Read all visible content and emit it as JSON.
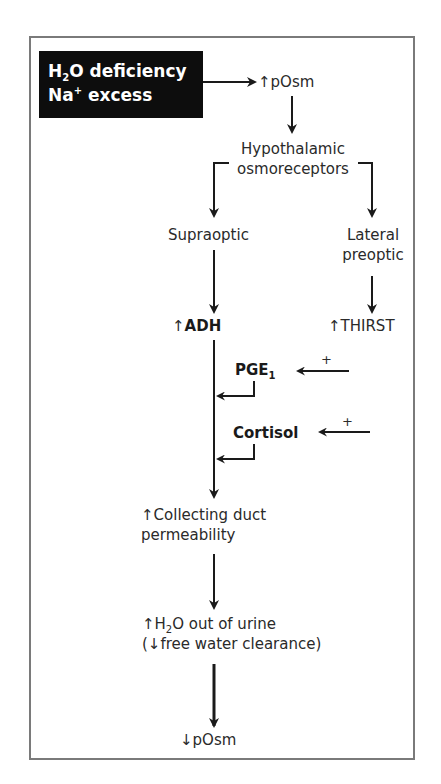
{
  "trigger": {
    "line1_prefix": "H",
    "line1_sub": "2",
    "line1_suffix": "O deficiency",
    "line2_prefix": "Na",
    "line2_sup": "+",
    "line2_suffix": " excess",
    "background_color": "#0d0d0d",
    "text_color": "#ffffff"
  },
  "nodes": {
    "posm_up": {
      "arrow": "↑",
      "label": "pOsm"
    },
    "hypothalamic": {
      "line1": "Hypothalamic",
      "line2": "osmoreceptors"
    },
    "supraoptic": {
      "label": "Supraoptic"
    },
    "lateral_preoptic": {
      "line1": "Lateral",
      "line2": "preoptic"
    },
    "adh": {
      "arrow": "↑",
      "label": "ADH"
    },
    "thirst": {
      "arrow": "↑",
      "label": "THIRST"
    },
    "pge": {
      "label": "PGE",
      "sub": "1",
      "modifier": "+"
    },
    "cortisol": {
      "label": "Cortisol",
      "modifier": "+"
    },
    "collecting_duct": {
      "arrow": "↑",
      "line1": "Collecting duct",
      "line2": "permeability"
    },
    "h2o_out": {
      "arrow": "↑",
      "line1_prefix": "H",
      "line1_sub": "2",
      "line1_suffix": "O out of urine",
      "line2": "(↓free water clearance)"
    },
    "posm_down": {
      "arrow": "↓",
      "label": "pOsm"
    }
  },
  "colors": {
    "frame_border": "#7a7a7a",
    "text": "#2a2a2a",
    "arrows": "#1a1a1a"
  }
}
